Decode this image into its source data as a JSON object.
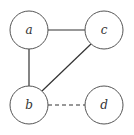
{
  "diagram": {
    "type": "graph",
    "nodes": [
      {
        "id": "a",
        "label": "a",
        "x": 29,
        "y": 30,
        "r": 19
      },
      {
        "id": "c",
        "label": "c",
        "x": 104,
        "y": 30,
        "r": 19
      },
      {
        "id": "b",
        "label": "b",
        "x": 29,
        "y": 105,
        "r": 19
      },
      {
        "id": "d",
        "label": "d",
        "x": 104,
        "y": 105,
        "r": 19
      }
    ],
    "edges": [
      {
        "from": "a",
        "to": "c",
        "style": "solid"
      },
      {
        "from": "a",
        "to": "b",
        "style": "solid"
      },
      {
        "from": "b",
        "to": "c",
        "style": "solid"
      },
      {
        "from": "b",
        "to": "d",
        "style": "dashed"
      }
    ]
  }
}
